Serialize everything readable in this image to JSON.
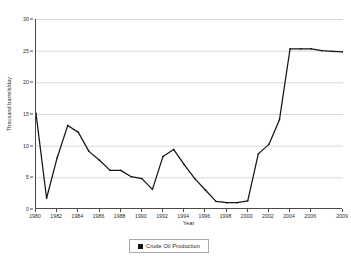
{
  "chart_data": {
    "type": "line",
    "title": "",
    "xlabel": "Year",
    "ylabel": "Thousand barrels/day",
    "xlim": [
      1980,
      2009
    ],
    "ylim": [
      0,
      30
    ],
    "grid": "horizontal",
    "legend_position": "bottom-center",
    "x_tick_labels": [
      "1980",
      "1982",
      "1984",
      "1986",
      "1988",
      "1990",
      "1992",
      "1994",
      "1996",
      "1998",
      "2000",
      "2002",
      "2004",
      "2006",
      "2009"
    ],
    "y_tick_labels": [
      "0",
      "5",
      "10",
      "15",
      "20",
      "25",
      "30"
    ],
    "y_ticks": [
      0,
      5,
      10,
      15,
      20,
      25,
      30
    ],
    "x": [
      1980,
      1981,
      1982,
      1983,
      1984,
      1985,
      1986,
      1987,
      1988,
      1989,
      1990,
      1991,
      1992,
      1993,
      1994,
      1995,
      1996,
      1997,
      1998,
      1999,
      2000,
      2001,
      2002,
      2003,
      2004,
      2005,
      2006,
      2007,
      2008,
      2009
    ],
    "series": [
      {
        "name": "Crude Oil Production",
        "color": "#151515",
        "values": [
          15.1,
          1.7,
          8.1,
          13.2,
          12.1,
          9.1,
          7.7,
          6.1,
          6.1,
          5.1,
          4.8,
          3.1,
          8.3,
          9.4,
          7.0,
          4.8,
          3.0,
          1.2,
          1.0,
          1.0,
          1.3,
          8.7,
          10.2,
          14.1,
          25.3,
          25.3,
          25.3,
          25.0,
          24.9,
          24.8
        ]
      }
    ]
  },
  "legend": {
    "label": "Crude Oil Production",
    "swatch_color": "#151515"
  },
  "axes": {
    "x_title": "Year",
    "y_title": "Thousand barrels/day"
  }
}
